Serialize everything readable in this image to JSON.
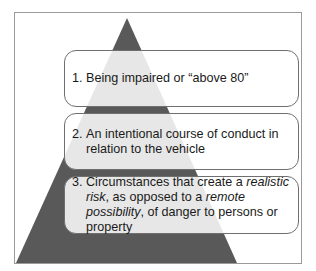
{
  "diagram": {
    "type": "pyramid",
    "triangle_color": "#595959",
    "levels": [
      {
        "number": "1.",
        "text": "Being impaired or “above 80”"
      },
      {
        "number": "2.",
        "text_line1": "An intentional course of conduct in",
        "text_line2": "relation to the vehicle"
      },
      {
        "number": "3.",
        "pre": "Circumstances that create a ",
        "em1": "realistic risk",
        "mid": ", as opposed to a ",
        "em2": "remote possibility",
        "post": ", of danger to persons or property"
      }
    ]
  }
}
